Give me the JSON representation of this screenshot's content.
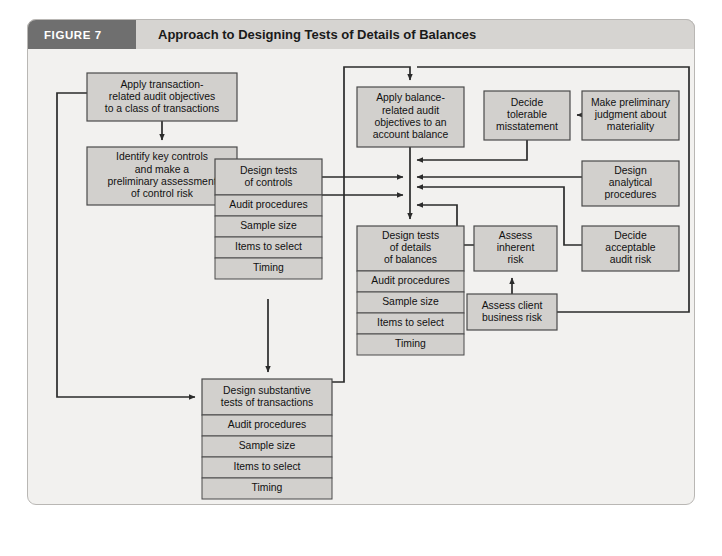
{
  "figure": {
    "tag": "FIGURE 7",
    "title": "Approach to Designing Tests of Details of Balances"
  },
  "colors": {
    "page_background": "#ffffff",
    "frame_background": "#f2f1ef",
    "frame_border": "#b9b7b4",
    "header_band": "#d6d4d1",
    "header_tag": "#6f6f6f",
    "node_fill": "#d2d0cd",
    "node_border": "#4a4a4a",
    "connector": "#2b2b2b",
    "text": "#111111"
  },
  "chart_data": {
    "type": "diagram",
    "title": "Approach to Designing Tests of Details of Balances",
    "nodes": [
      {
        "id": "apply-transaction-related",
        "label": "Apply transaction-\nrelated audit objectives\nto a class of transactions",
        "lines": [
          "Apply transaction-",
          "related audit objectives",
          "to a class of transactions"
        ],
        "x": 60,
        "y": 24,
        "w": 150,
        "h": 48
      },
      {
        "id": "identify-key-controls",
        "label": "Identify key controls\nand make a\npreliminary assessment\nof control risk",
        "lines": [
          "Identify key controls",
          "and make a",
          "preliminary assessment",
          "of control risk"
        ],
        "x": 60,
        "y": 98,
        "w": 150,
        "h": 58
      },
      {
        "id": "design-tests-of-controls",
        "label": "Design tests\nof controls",
        "lines": [
          "Design tests",
          "of controls"
        ],
        "x": 188,
        "y": 110,
        "w": 107,
        "h": 36,
        "subitems": [
          "Audit procedures",
          "Sample size",
          "Items to select",
          "Timing"
        ]
      },
      {
        "id": "design-substantive-tests",
        "label": "Design substantive\ntests of transactions",
        "lines": [
          "Design substantive",
          "tests of transactions"
        ],
        "x": 175,
        "y": 330,
        "w": 130,
        "h": 36,
        "subitems": [
          "Audit procedures",
          "Sample size",
          "Items to select",
          "Timing"
        ]
      },
      {
        "id": "apply-balance-related",
        "label": "Apply balance-\nrelated audit\nobjectives to an\naccount balance",
        "lines": [
          "Apply balance-",
          "related audit",
          "objectives to an",
          "account balance"
        ],
        "x": 330,
        "y": 38,
        "w": 107,
        "h": 60
      },
      {
        "id": "design-tests-of-details",
        "label": "Design tests\nof details\nof balances",
        "lines": [
          "Design tests",
          "of details",
          "of balances"
        ],
        "x": 330,
        "y": 177,
        "w": 107,
        "h": 45,
        "subitems": [
          "Audit procedures",
          "Sample size",
          "Items to select",
          "Timing"
        ]
      },
      {
        "id": "decide-tolerable-misstatement",
        "label": "Decide\ntolerable\nmisstatement",
        "lines": [
          "Decide",
          "tolerable",
          "misstatement"
        ],
        "x": 457,
        "y": 42,
        "w": 86,
        "h": 49
      },
      {
        "id": "make-preliminary-judgment",
        "label": "Make preliminary\njudgment about\nmateriality",
        "lines": [
          "Make preliminary",
          "judgment about",
          "materiality"
        ],
        "x": 555,
        "y": 42,
        "w": 97,
        "h": 49
      },
      {
        "id": "design-analytical-procedures",
        "label": "Design\nanalytical\nprocedures",
        "lines": [
          "Design",
          "analytical",
          "procedures"
        ],
        "x": 555,
        "y": 112,
        "w": 97,
        "h": 45
      },
      {
        "id": "decide-acceptable-audit-risk",
        "label": "Decide\nacceptable\naudit risk",
        "lines": [
          "Decide",
          "acceptable",
          "audit risk"
        ],
        "x": 555,
        "y": 177,
        "w": 97,
        "h": 45
      },
      {
        "id": "assess-inherent-risk",
        "label": "Assess\ninherent\nrisk",
        "lines": [
          "Assess",
          "inherent",
          "risk"
        ],
        "x": 447,
        "y": 177,
        "w": 83,
        "h": 45
      },
      {
        "id": "assess-client-business-risk",
        "label": "Assess client\nbusiness risk",
        "lines": [
          "Assess client",
          "business risk"
        ],
        "x": 440,
        "y": 245,
        "w": 90,
        "h": 36
      }
    ],
    "subitem_labels": [
      "Audit procedures",
      "Sample size",
      "Items to select",
      "Timing"
    ],
    "edges": [
      {
        "from": "apply-transaction-related",
        "to": "identify-key-controls",
        "type": "arrow-down"
      },
      {
        "from": "identify-key-controls",
        "to": "design-tests-of-controls",
        "type": "arrow-right"
      },
      {
        "from": "design-tests-of-controls",
        "to": "junction",
        "type": "arrow-right"
      },
      {
        "from": "design-tests-of-controls",
        "to": "design-substantive-tests",
        "type": "arrow-down"
      },
      {
        "from": "design-substantive-tests",
        "to": "junction",
        "type": "elbow-up-right"
      },
      {
        "from": "design-substantive-tests",
        "to": "apply-balance-related",
        "type": "elbow-top-loop"
      },
      {
        "from": "apply-balance-related",
        "to": "design-tests-of-details",
        "type": "arrow-down-junction"
      },
      {
        "from": "decide-tolerable-misstatement",
        "to": "junction",
        "type": "elbow-left"
      },
      {
        "from": "make-preliminary-judgment",
        "to": "decide-tolerable-misstatement",
        "type": "arrow-left"
      },
      {
        "from": "design-analytical-procedures",
        "to": "junction",
        "type": "arrow-left"
      },
      {
        "from": "decide-acceptable-audit-risk",
        "to": "junction",
        "type": "elbow-left-up"
      },
      {
        "from": "assess-inherent-risk",
        "to": "junction",
        "type": "elbow-left-up"
      },
      {
        "from": "assess-client-business-risk",
        "to": "assess-inherent-risk",
        "type": "arrow-up"
      },
      {
        "from": "assess-client-business-risk",
        "to": "top-loop",
        "type": "elbow-right-up"
      }
    ]
  }
}
